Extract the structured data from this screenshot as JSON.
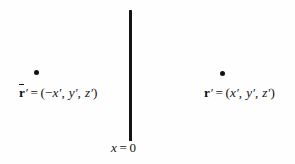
{
  "figure": {
    "name": "mirror-image-charge-geometry",
    "background_color": "#fefefe",
    "ink_color": "#141414",
    "width": 295,
    "height": 164
  },
  "plane": {
    "name": "boundary-plane",
    "label": "x = 0",
    "label_var": "x",
    "label_op": "=",
    "label_value": "0",
    "orientation": "vertical",
    "color": "#141414"
  },
  "points": [
    {
      "id": "mirror-point",
      "side": "left",
      "marker": "filled-dot",
      "symbol": "r",
      "has_overbar": true,
      "has_prime": true,
      "relation": "=",
      "open_paren": "(",
      "close_paren": ")",
      "components": [
        "−x′",
        "y′",
        "z′"
      ],
      "component_x_sign": "−",
      "component_x": "x",
      "component_y": "y",
      "component_z": "z",
      "comma": ",",
      "full_text": "r̄′ = (−x′, y′, z′)"
    },
    {
      "id": "source-point",
      "side": "right",
      "marker": "filled-dot",
      "symbol": "r",
      "has_overbar": false,
      "has_prime": true,
      "relation": "=",
      "open_paren": "(",
      "close_paren": ")",
      "components": [
        "x′",
        "y′",
        "z′"
      ],
      "component_x": "x",
      "component_y": "y",
      "component_z": "z",
      "comma": ",",
      "full_text": "r′ = (x′, y′, z′)"
    }
  ],
  "glyphs": {
    "prime": "′",
    "minus": "−",
    "equals": "=",
    "comma": ",",
    "lparen": "(",
    "rparen": ")",
    "r": "r",
    "x": "x",
    "y": "y",
    "z": "z",
    "zero": "0"
  }
}
